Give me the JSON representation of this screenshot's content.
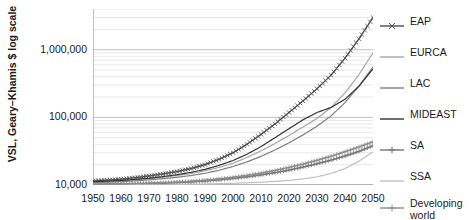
{
  "chart_data": {
    "type": "line",
    "title": "",
    "xlabel": "",
    "ylabel": "VSL, Geary–Khamis $ log scale",
    "yscale": "log",
    "ylim": [
      10000,
      4000000
    ],
    "xlim": [
      1950,
      2050
    ],
    "grid": true,
    "legend_position": "right",
    "y_ticks": [
      "10,000",
      "100,000",
      "1,000,000"
    ],
    "y_tick_values": [
      10000,
      100000,
      1000000
    ],
    "x_ticks": [
      "1950",
      "1960",
      "1970",
      "1980",
      "1990",
      "2000",
      "2010",
      "2020",
      "2030",
      "2040",
      "2050"
    ],
    "x_tick_values": [
      1950,
      1960,
      1970,
      1980,
      1990,
      2000,
      2010,
      2020,
      2030,
      2040,
      2050
    ],
    "x": [
      1950,
      1955,
      1960,
      1965,
      1970,
      1975,
      1980,
      1985,
      1990,
      1995,
      2000,
      2005,
      2010,
      2015,
      2020,
      2025,
      2030,
      2035,
      2040,
      2045,
      2050
    ],
    "series": [
      {
        "name": "EAP",
        "color": "#4d4d4d",
        "marker": "x",
        "values": [
          11500,
          11800,
          12200,
          12800,
          13600,
          14600,
          15800,
          17500,
          20000,
          24000,
          30000,
          40000,
          56000,
          80000,
          118000,
          175000,
          265000,
          420000,
          750000,
          1450000,
          3000000
        ]
      },
      {
        "name": "EURCA",
        "color": "#a6a6a6",
        "marker": "none",
        "values": [
          11000,
          11200,
          11500,
          11900,
          12400,
          13000,
          13800,
          14800,
          16200,
          18200,
          21000,
          25500,
          32000,
          41000,
          54000,
          72000,
          96000,
          140000,
          230000,
          430000,
          900000
        ]
      },
      {
        "name": "LAC",
        "color": "#808080",
        "marker": "none",
        "values": [
          10900,
          11000,
          11200,
          11500,
          11900,
          12400,
          13000,
          13800,
          14900,
          16500,
          18800,
          22000,
          26500,
          33000,
          42000,
          55000,
          74000,
          105000,
          165000,
          290000,
          560000
        ]
      },
      {
        "name": "MIDEAST",
        "color": "#333333",
        "marker": "none",
        "values": [
          11200,
          11400,
          11700,
          12100,
          12600,
          13300,
          14200,
          15400,
          17000,
          19500,
          23000,
          28500,
          37000,
          50000,
          68000,
          92000,
          118000,
          140000,
          185000,
          290000,
          520000
        ]
      },
      {
        "name": "SA",
        "color": "#737373",
        "marker": "plus",
        "values": [
          10200,
          10250,
          10300,
          10400,
          10500,
          10650,
          10850,
          11100,
          11450,
          11900,
          12500,
          13200,
          14100,
          15200,
          16600,
          18400,
          20600,
          23300,
          26800,
          31500,
          38000
        ]
      },
      {
        "name": "SSA",
        "color": "#bfbfbf",
        "marker": "none",
        "values": [
          10050,
          10060,
          10080,
          10100,
          10130,
          10170,
          10220,
          10280,
          10360,
          10460,
          10600,
          10780,
          11000,
          11300,
          11700,
          12300,
          13200,
          14800,
          17500,
          22500,
          31000
        ]
      },
      {
        "name": "Developing\nworld",
        "color": "#8c8c8c",
        "marker": "plus",
        "values": [
          10300,
          10350,
          10420,
          10520,
          10650,
          10820,
          11050,
          11350,
          11750,
          12300,
          13000,
          13900,
          15000,
          16400,
          18200,
          20400,
          23200,
          26600,
          31000,
          36500,
          43500
        ]
      }
    ]
  },
  "legend": {
    "items": [
      {
        "label": "EAP"
      },
      {
        "label": "EURCA"
      },
      {
        "label": "LAC"
      },
      {
        "label": "MIDEAST"
      },
      {
        "label": "SA"
      },
      {
        "label": "SSA"
      },
      {
        "label": "Developing\nworld"
      }
    ]
  }
}
